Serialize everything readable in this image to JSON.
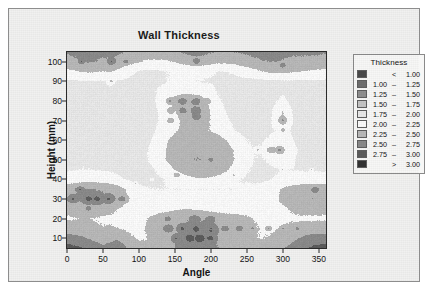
{
  "chart_data": {
    "type": "heatmap",
    "title": "Wall Thickness",
    "xlabel": "Angle",
    "ylabel": "Height (mm)",
    "xlim": [
      0,
      360
    ],
    "ylim": [
      5,
      105
    ],
    "xticks": [
      0,
      50,
      100,
      150,
      200,
      250,
      300,
      350
    ],
    "yticks": [
      10,
      20,
      30,
      40,
      50,
      60,
      70,
      80,
      90,
      100
    ],
    "grid": false,
    "legend_position": "right",
    "legend_title": "Thickness",
    "legend_entries": [
      {
        "low": "",
        "dash": "<",
        "high": "1.00",
        "color": "#4a4a4a"
      },
      {
        "low": "1.00",
        "dash": "–",
        "high": "1.25",
        "color": "#6e6e6e"
      },
      {
        "low": "1.25",
        "dash": "–",
        "high": "1.50",
        "color": "#8f8f8f"
      },
      {
        "low": "1.50",
        "dash": "–",
        "high": "1.75",
        "color": "#c4c4c4"
      },
      {
        "low": "1.75",
        "dash": "–",
        "high": "2.00",
        "color": "#e8e8e8"
      },
      {
        "low": "2.00",
        "dash": "–",
        "high": "2.25",
        "color": "#fafafa"
      },
      {
        "low": "2.25",
        "dash": "–",
        "high": "2.50",
        "color": "#b8b8b8"
      },
      {
        "low": "2.50",
        "dash": "–",
        "high": "2.75",
        "color": "#8a8a8a"
      },
      {
        "low": "2.75",
        "dash": "–",
        "high": "3.00",
        "color": "#5c5c5c"
      },
      {
        "low": "",
        "dash": ">",
        "high": "3.00",
        "color": "#333333"
      }
    ],
    "levels": [
      1.0,
      1.25,
      1.5,
      1.75,
      2.0,
      2.25,
      2.5,
      2.75,
      3.0
    ],
    "x": [
      0,
      10,
      20,
      30,
      40,
      50,
      60,
      70,
      80,
      90,
      100,
      110,
      120,
      130,
      140,
      150,
      160,
      170,
      180,
      190,
      200,
      210,
      220,
      230,
      240,
      250,
      260,
      270,
      280,
      290,
      300,
      310,
      320,
      330,
      340,
      350,
      360
    ],
    "y": [
      5,
      10,
      15,
      20,
      25,
      30,
      35,
      40,
      45,
      50,
      55,
      60,
      65,
      70,
      75,
      80,
      85,
      90,
      95,
      100,
      105
    ],
    "z": [
      [
        2.85,
        2.8,
        2.78,
        2.7,
        2.62,
        2.55,
        2.6,
        2.68,
        2.55,
        2.42,
        2.35,
        2.32,
        2.35,
        2.4,
        2.45,
        2.5,
        2.55,
        2.58,
        2.6,
        2.58,
        2.55,
        2.5,
        2.46,
        2.42,
        2.4,
        2.38,
        2.36,
        2.35,
        2.38,
        2.42,
        2.48,
        2.55,
        2.62,
        2.7,
        2.78,
        2.82,
        2.85
      ],
      [
        2.62,
        2.58,
        2.55,
        2.48,
        2.42,
        2.38,
        2.42,
        2.46,
        2.38,
        2.28,
        2.22,
        2.24,
        2.3,
        2.36,
        2.42,
        2.48,
        2.55,
        2.62,
        2.66,
        2.62,
        2.56,
        2.48,
        2.42,
        2.36,
        2.34,
        2.3,
        2.26,
        2.24,
        2.26,
        2.3,
        2.36,
        2.42,
        2.48,
        2.55,
        2.6,
        2.62,
        2.62
      ],
      [
        2.35,
        2.34,
        2.32,
        2.3,
        2.28,
        2.26,
        2.28,
        2.26,
        2.22,
        2.18,
        2.2,
        2.26,
        2.32,
        2.38,
        2.42,
        2.46,
        2.52,
        2.58,
        2.56,
        2.52,
        2.48,
        2.44,
        2.4,
        2.38,
        2.36,
        2.32,
        2.28,
        2.24,
        2.22,
        2.24,
        2.28,
        2.3,
        2.32,
        2.34,
        2.35,
        2.35,
        2.35
      ],
      [
        2.22,
        2.24,
        2.26,
        2.26,
        2.24,
        2.22,
        2.2,
        2.18,
        2.14,
        2.12,
        2.16,
        2.24,
        2.3,
        2.34,
        2.38,
        2.42,
        2.46,
        2.48,
        2.46,
        2.44,
        2.42,
        2.4,
        2.38,
        2.36,
        2.34,
        2.3,
        2.24,
        2.2,
        2.18,
        2.18,
        2.2,
        2.22,
        2.22,
        2.22,
        2.22,
        2.22,
        2.22
      ],
      [
        2.3,
        2.34,
        2.38,
        2.4,
        2.38,
        2.36,
        2.32,
        2.26,
        2.2,
        2.14,
        2.12,
        2.14,
        2.16,
        2.18,
        2.2,
        2.22,
        2.24,
        2.24,
        2.22,
        2.2,
        2.18,
        2.16,
        2.14,
        2.12,
        2.12,
        2.12,
        2.12,
        2.12,
        2.14,
        2.18,
        2.22,
        2.26,
        2.3,
        2.32,
        2.32,
        2.31,
        2.3
      ],
      [
        2.48,
        2.52,
        2.56,
        2.58,
        2.56,
        2.54,
        2.5,
        2.44,
        2.32,
        2.2,
        2.12,
        2.08,
        2.06,
        2.06,
        2.08,
        2.08,
        2.08,
        2.08,
        2.08,
        2.08,
        2.08,
        2.08,
        2.08,
        2.08,
        2.08,
        2.08,
        2.1,
        2.12,
        2.16,
        2.22,
        2.3,
        2.38,
        2.44,
        2.48,
        2.5,
        2.49,
        2.48
      ],
      [
        2.42,
        2.46,
        2.5,
        2.52,
        2.5,
        2.48,
        2.44,
        2.38,
        2.26,
        2.14,
        2.06,
        2.02,
        2.0,
        2.0,
        2.0,
        2.0,
        2.0,
        2.0,
        2.0,
        2.0,
        2.0,
        2.0,
        2.0,
        2.0,
        2.02,
        2.04,
        2.06,
        2.1,
        2.14,
        2.2,
        2.28,
        2.34,
        2.38,
        2.42,
        2.43,
        2.42,
        2.42
      ],
      [
        2.1,
        2.12,
        2.14,
        2.16,
        2.14,
        2.12,
        2.1,
        2.06,
        2.0,
        1.96,
        1.94,
        1.94,
        1.96,
        1.98,
        2.02,
        2.06,
        2.12,
        2.18,
        2.22,
        2.22,
        2.2,
        2.16,
        2.1,
        2.04,
        2.0,
        1.98,
        1.96,
        1.96,
        1.98,
        2.02,
        2.06,
        2.08,
        2.1,
        2.1,
        2.1,
        2.1,
        2.1
      ],
      [
        1.98,
        1.99,
        2.0,
        2.0,
        1.99,
        1.98,
        1.97,
        1.95,
        1.93,
        1.92,
        1.92,
        1.94,
        1.98,
        2.06,
        2.16,
        2.26,
        2.34,
        2.4,
        2.44,
        2.44,
        2.42,
        2.38,
        2.3,
        2.2,
        2.1,
        2.02,
        1.98,
        1.96,
        1.96,
        1.98,
        2.0,
        2.0,
        1.99,
        1.98,
        1.98,
        1.98,
        1.98
      ],
      [
        1.96,
        1.97,
        1.98,
        1.98,
        1.97,
        1.96,
        1.95,
        1.94,
        1.93,
        1.93,
        1.94,
        1.98,
        2.06,
        2.16,
        2.28,
        2.38,
        2.44,
        2.48,
        2.5,
        2.49,
        2.47,
        2.44,
        2.38,
        2.28,
        2.16,
        2.06,
        2.0,
        1.98,
        2.02,
        2.1,
        2.16,
        2.08,
        1.98,
        1.96,
        1.95,
        1.95,
        1.96
      ],
      [
        1.95,
        1.96,
        1.97,
        1.97,
        1.96,
        1.95,
        1.94,
        1.93,
        1.92,
        1.93,
        1.94,
        1.98,
        2.06,
        2.16,
        2.28,
        2.38,
        2.44,
        2.47,
        2.48,
        2.47,
        2.45,
        2.42,
        2.36,
        2.26,
        2.14,
        2.04,
        2.0,
        2.02,
        2.12,
        2.26,
        2.3,
        2.14,
        2.0,
        1.96,
        1.95,
        1.95,
        1.95
      ],
      [
        1.94,
        1.95,
        1.96,
        1.96,
        1.95,
        1.94,
        1.93,
        1.92,
        1.92,
        1.92,
        1.93,
        1.96,
        2.02,
        2.12,
        2.24,
        2.34,
        2.4,
        2.42,
        2.42,
        2.4,
        2.38,
        2.34,
        2.26,
        2.16,
        2.06,
        2.0,
        1.98,
        1.98,
        2.02,
        2.1,
        2.14,
        2.04,
        1.96,
        1.94,
        1.94,
        1.94,
        1.94
      ],
      [
        1.93,
        1.94,
        1.95,
        1.95,
        1.94,
        1.93,
        1.92,
        1.92,
        1.91,
        1.91,
        1.92,
        1.94,
        1.98,
        2.06,
        2.14,
        2.22,
        2.28,
        2.3,
        2.3,
        2.28,
        2.24,
        2.18,
        2.1,
        2.02,
        1.97,
        1.95,
        1.94,
        1.94,
        1.96,
        2.0,
        2.06,
        2.0,
        1.94,
        1.93,
        1.93,
        1.93,
        1.93
      ],
      [
        1.92,
        1.93,
        1.94,
        1.94,
        1.93,
        1.92,
        1.92,
        1.91,
        1.9,
        1.9,
        1.91,
        1.93,
        1.96,
        2.02,
        2.1,
        2.18,
        2.28,
        2.34,
        2.36,
        2.32,
        2.24,
        2.14,
        2.04,
        1.98,
        1.95,
        1.93,
        1.92,
        1.92,
        1.94,
        2.1,
        2.28,
        2.06,
        1.93,
        1.92,
        1.92,
        1.92,
        1.92
      ],
      [
        1.92,
        1.92,
        1.93,
        1.93,
        1.93,
        1.92,
        1.91,
        1.9,
        1.9,
        1.9,
        1.91,
        1.93,
        1.96,
        2.02,
        2.12,
        2.24,
        2.36,
        2.42,
        2.42,
        2.36,
        2.24,
        2.1,
        2.0,
        1.95,
        1.93,
        1.92,
        1.91,
        1.91,
        1.92,
        2.08,
        2.26,
        2.04,
        1.92,
        1.91,
        1.91,
        1.91,
        1.92
      ],
      [
        1.93,
        1.93,
        1.94,
        1.94,
        1.94,
        1.93,
        1.92,
        1.91,
        1.91,
        1.91,
        1.92,
        1.94,
        1.98,
        2.06,
        2.22,
        2.36,
        2.42,
        2.4,
        2.38,
        2.32,
        2.18,
        2.04,
        1.96,
        1.93,
        1.92,
        1.91,
        1.91,
        1.91,
        1.92,
        1.98,
        2.06,
        1.96,
        1.92,
        1.92,
        1.92,
        1.93,
        1.93
      ],
      [
        1.94,
        1.95,
        1.96,
        1.96,
        1.96,
        1.95,
        1.94,
        1.93,
        1.92,
        1.92,
        1.93,
        1.95,
        1.98,
        2.02,
        2.08,
        2.14,
        2.18,
        2.18,
        2.16,
        2.12,
        2.06,
        1.98,
        1.94,
        1.92,
        1.92,
        1.91,
        1.91,
        1.91,
        1.92,
        1.94,
        1.96,
        1.94,
        1.93,
        1.93,
        1.94,
        1.94,
        1.94
      ],
      [
        1.96,
        1.97,
        1.98,
        1.99,
        1.99,
        1.98,
        2.06,
        1.98,
        1.96,
        1.95,
        1.95,
        1.96,
        1.97,
        1.98,
        2.0,
        2.02,
        2.02,
        2.02,
        2.0,
        1.99,
        1.98,
        1.96,
        1.95,
        1.94,
        1.94,
        1.93,
        1.93,
        1.94,
        1.95,
        1.96,
        1.97,
        1.97,
        1.97,
        1.97,
        1.97,
        1.96,
        1.96
      ],
      [
        2.18,
        2.22,
        2.26,
        2.28,
        2.26,
        2.24,
        2.26,
        2.2,
        2.12,
        2.04,
        1.98,
        1.96,
        1.96,
        1.98,
        2.0,
        2.02,
        2.04,
        2.06,
        2.06,
        2.04,
        2.02,
        2.0,
        2.0,
        2.02,
        2.06,
        2.12,
        2.18,
        2.24,
        2.28,
        2.3,
        2.3,
        2.28,
        2.26,
        2.24,
        2.22,
        2.2,
        2.18
      ],
      [
        2.42,
        2.46,
        2.5,
        2.52,
        2.5,
        2.46,
        2.48,
        2.44,
        2.38,
        2.32,
        2.26,
        2.22,
        2.2,
        2.2,
        2.22,
        2.26,
        2.32,
        2.36,
        2.4,
        2.38,
        2.34,
        2.3,
        2.3,
        2.32,
        2.36,
        2.4,
        2.44,
        2.48,
        2.5,
        2.5,
        2.48,
        2.46,
        2.44,
        2.44,
        2.44,
        2.43,
        2.42
      ],
      [
        2.52,
        2.54,
        2.56,
        2.58,
        2.56,
        2.54,
        2.56,
        2.54,
        2.5,
        2.46,
        2.42,
        2.4,
        2.4,
        2.42,
        2.44,
        2.48,
        2.52,
        2.56,
        2.58,
        2.56,
        2.52,
        2.48,
        2.48,
        2.5,
        2.52,
        2.54,
        2.56,
        2.58,
        2.58,
        2.58,
        2.56,
        2.54,
        2.54,
        2.54,
        2.54,
        2.53,
        2.52
      ]
    ]
  },
  "title": {
    "text": "Wall Thickness"
  },
  "axes": {
    "x": {
      "label": "Angle",
      "ticks": [
        "0",
        "50",
        "100",
        "150",
        "200",
        "250",
        "300",
        "350"
      ]
    },
    "y": {
      "label": "Height (mm)",
      "ticks": [
        "10",
        "20",
        "30",
        "40",
        "50",
        "60",
        "70",
        "80",
        "90",
        "100"
      ]
    }
  },
  "legend": {
    "title": "Thickness"
  }
}
